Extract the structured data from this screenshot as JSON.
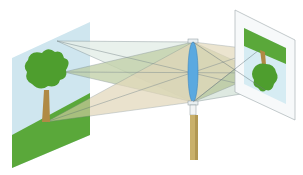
{
  "diagram": {
    "title": "",
    "colors": {
      "object_panel": "#cfe6ef",
      "grass": "#5aa83a",
      "tree_foliage": "#4e9e2e",
      "trunk": "#b08a45",
      "lens": "#5aa9e0",
      "stand": "#c9b06a",
      "ray_fill_green": "#a9c08a",
      "ray_fill_tan": "#d9ccaa",
      "ray_fill_light": "#cfe2d6",
      "ray_line": "#6a7a7e",
      "screen": "#f4f6f7",
      "image_panel": "#d6ecf3"
    },
    "elements": [
      {
        "id": "object",
        "label": ""
      },
      {
        "id": "lens",
        "label": ""
      },
      {
        "id": "lens-stand",
        "label": ""
      },
      {
        "id": "screen-image",
        "label": ""
      }
    ]
  }
}
